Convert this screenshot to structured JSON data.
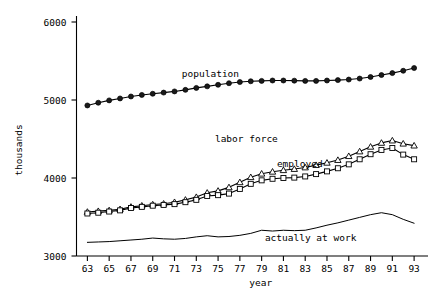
{
  "chart_data": {
    "type": "line",
    "title": "",
    "xlabel": "year",
    "ylabel": "thousands",
    "xlim": [
      62,
      94
    ],
    "ylim": [
      3000,
      6150
    ],
    "grid": false,
    "legend_position": "inline-annotations",
    "x": [
      63,
      64,
      65,
      66,
      67,
      68,
      69,
      70,
      71,
      72,
      73,
      74,
      75,
      76,
      77,
      78,
      79,
      80,
      81,
      82,
      83,
      84,
      85,
      86,
      87,
      88,
      89,
      90,
      91,
      92,
      93
    ],
    "xticks": [
      63,
      65,
      67,
      69,
      71,
      73,
      75,
      77,
      79,
      81,
      83,
      85,
      87,
      89,
      91,
      93
    ],
    "xtick_labels": [
      "63",
      "65",
      "67",
      "69",
      "71",
      "73",
      "75",
      "77",
      "79",
      "81",
      "83",
      "85",
      "87",
      "89",
      "91",
      "93"
    ],
    "yticks": [
      3000,
      4000,
      5000,
      6000
    ],
    "ytick_labels": [
      "3000",
      "4000",
      "5000",
      "6000"
    ],
    "series": [
      {
        "name": "population",
        "marker": "circle",
        "label": "population",
        "label_x": 74.3,
        "label_y": 5290,
        "values": [
          4930,
          4965,
          4995,
          5020,
          5045,
          5065,
          5080,
          5095,
          5110,
          5130,
          5155,
          5175,
          5195,
          5215,
          5230,
          5240,
          5245,
          5250,
          5250,
          5248,
          5245,
          5245,
          5250,
          5255,
          5262,
          5275,
          5295,
          5320,
          5345,
          5375,
          5410
        ]
      },
      {
        "name": "labor force",
        "marker": "triangle",
        "label": "labor force",
        "label_x": 77.6,
        "label_y": 4460,
        "values": [
          3565,
          3575,
          3585,
          3600,
          3630,
          3645,
          3660,
          3670,
          3690,
          3720,
          3755,
          3810,
          3835,
          3880,
          3945,
          4010,
          4055,
          4080,
          4100,
          4115,
          4135,
          4165,
          4195,
          4230,
          4280,
          4340,
          4400,
          4450,
          4480,
          4440,
          4415
        ]
      },
      {
        "name": "employed",
        "marker": "square",
        "label": "employed",
        "label_x": 82.5,
        "label_y": 4145,
        "values": [
          3545,
          3555,
          3570,
          3585,
          3615,
          3630,
          3645,
          3655,
          3665,
          3690,
          3720,
          3770,
          3780,
          3800,
          3860,
          3925,
          3970,
          3990,
          4000,
          4005,
          4020,
          4050,
          4085,
          4125,
          4175,
          4240,
          4305,
          4360,
          4385,
          4300,
          4240
        ]
      },
      {
        "name": "actually at work",
        "marker": "none",
        "label": "actually at work",
        "label_x": 83.5,
        "label_y": 3195,
        "values": [
          3175,
          3180,
          3185,
          3195,
          3205,
          3215,
          3230,
          3220,
          3215,
          3225,
          3245,
          3260,
          3245,
          3250,
          3265,
          3290,
          3330,
          3320,
          3330,
          3325,
          3330,
          3360,
          3395,
          3425,
          3460,
          3495,
          3530,
          3555,
          3530,
          3470,
          3420
        ]
      }
    ]
  }
}
